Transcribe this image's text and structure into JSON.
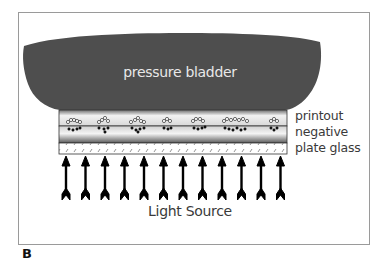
{
  "figure": {
    "panel_letter": "B",
    "labels": {
      "bladder": "pressure bladder",
      "printout": "printout",
      "negative": "negative",
      "glass": "plate glass",
      "light": "Light Source"
    },
    "colors": {
      "bladder": "#4e4e4e",
      "frame": "#9a9a9a",
      "text": "#3a3a3a",
      "arrow": "#000000"
    },
    "arrow_count": 12,
    "particle_cluster_count": 7
  }
}
